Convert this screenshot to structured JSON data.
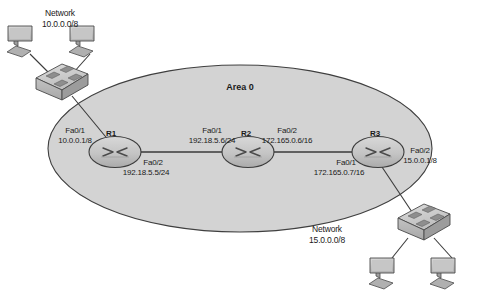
{
  "diagram": {
    "area_label": "Area 0",
    "colors": {
      "area_fill": "#d3d3d3",
      "area_stroke": "#3f3f3f",
      "device_fill": "#c9c9c9",
      "device_stroke": "#454545",
      "link_stroke": "#3a3a3a",
      "text": "#1a1a1a"
    },
    "networks": [
      {
        "id": "net-left",
        "title": "Network",
        "address": "10.0.0.0/8"
      },
      {
        "id": "net-right",
        "title": "Network",
        "address": "15.0.0.0/8"
      }
    ],
    "routers": [
      {
        "id": "r1",
        "name": "R1",
        "interfaces": [
          {
            "port": "Fa0/1",
            "address": "10.0.0.1/8"
          },
          {
            "port": "Fa0/2",
            "address": "192.18.5.5/24"
          }
        ]
      },
      {
        "id": "r2",
        "name": "R2",
        "interfaces": [
          {
            "port": "Fa0/1",
            "address": "192.18.5.6/24"
          },
          {
            "port": "Fa0/2",
            "address": "172.165.0.6/16"
          }
        ]
      },
      {
        "id": "r3",
        "name": "R3",
        "interfaces": [
          {
            "port": "Fa0/1",
            "address": "172.165.0.7/16"
          },
          {
            "port": "Fa0/2",
            "address": "15.0.0.1/8"
          }
        ]
      }
    ],
    "switches": [
      {
        "id": "sw-left",
        "name": "switch-left"
      },
      {
        "id": "sw-right",
        "name": "switch-right"
      }
    ],
    "workstations": [
      {
        "id": "pc-1",
        "name": "workstation-top-left-a"
      },
      {
        "id": "pc-2",
        "name": "workstation-top-left-b"
      },
      {
        "id": "pc-3",
        "name": "workstation-bottom-right-a"
      },
      {
        "id": "pc-4",
        "name": "workstation-bottom-right-b"
      }
    ]
  }
}
